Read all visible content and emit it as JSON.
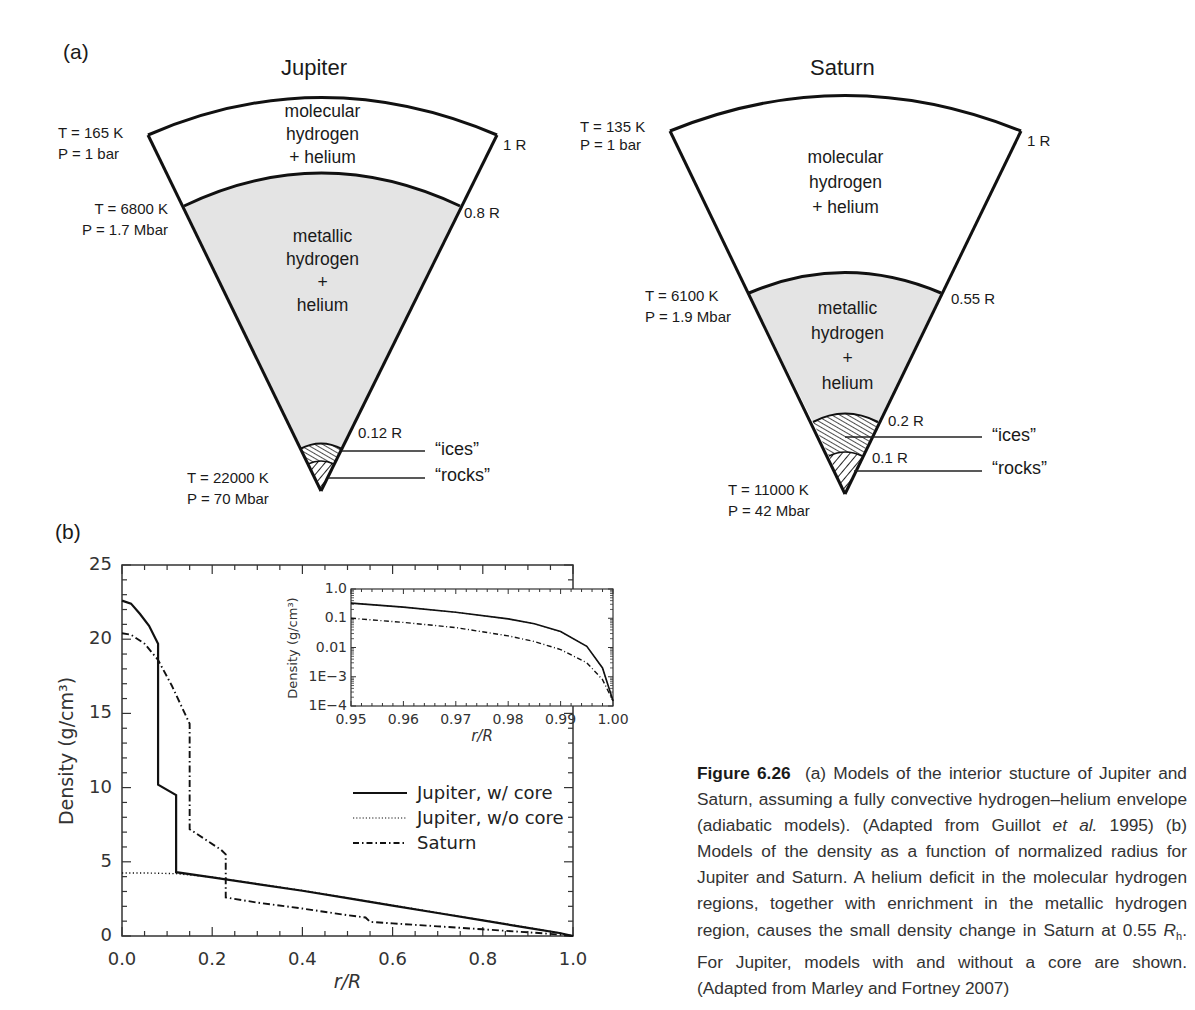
{
  "panel_a": {
    "label": "(a)",
    "jupiter": {
      "title": "Jupiter",
      "outer": {
        "T": "T = 165 K",
        "P": "P = 1 bar",
        "radius": "1 R"
      },
      "molecular_layer": [
        "molecular",
        "hydrogen",
        "+ helium"
      ],
      "transition": {
        "T": "T = 6800 K",
        "P": "P = 1.7 Mbar",
        "radius": "0.8 R"
      },
      "metallic_layer": [
        "metallic",
        "hydrogen",
        "+",
        "helium"
      ],
      "core_radius": "0.12 R",
      "ices_label": "“ices”",
      "rocks_label": "“rocks”",
      "center": {
        "T": "T = 22000 K",
        "P": "P = 70 Mbar"
      }
    },
    "saturn": {
      "title": "Saturn",
      "outer": {
        "T": "T = 135 K",
        "P": "P = 1 bar",
        "radius": "1 R"
      },
      "molecular_layer": [
        "molecular",
        "hydrogen",
        "+ helium"
      ],
      "transition": {
        "T": "T = 6100 K",
        "P": "P = 1.9 Mbar",
        "radius": "0.55 R"
      },
      "metallic_layer": [
        "metallic",
        "hydrogen",
        "+",
        "helium"
      ],
      "ices_radius": "0.2 R",
      "rocks_radius": "0.1 R",
      "ices_label": "“ices”",
      "rocks_label": "“rocks”",
      "center": {
        "T": "T = 11000 K",
        "P": "P = 42 Mbar"
      }
    }
  },
  "panel_b": {
    "label": "(b)"
  },
  "chart_data": [
    {
      "type": "line",
      "title": "",
      "xlabel": "r/R",
      "ylabel": "Density (g/cm³)",
      "xlim": [
        0.0,
        1.0
      ],
      "ylim": [
        0,
        25
      ],
      "xticks": [
        "0.0",
        "0.2",
        "0.4",
        "0.6",
        "0.8",
        "1.0"
      ],
      "yticks": [
        "0",
        "5",
        "10",
        "15",
        "20",
        "25"
      ],
      "grid": false,
      "legend_position": "center-right",
      "series": [
        {
          "name": "Jupiter, w/ core",
          "style": "solid",
          "x": [
            0.0,
            0.02,
            0.04,
            0.06,
            0.08,
            0.08,
            0.12,
            0.12,
            0.2,
            0.3,
            0.4,
            0.5,
            0.6,
            0.7,
            0.8,
            0.9,
            0.97,
            1.0
          ],
          "y": [
            22.6,
            22.4,
            21.7,
            20.9,
            19.7,
            10.2,
            9.5,
            4.3,
            3.95,
            3.5,
            3.05,
            2.55,
            2.05,
            1.55,
            1.05,
            0.55,
            0.2,
            0.0
          ]
        },
        {
          "name": "Jupiter, w/o core",
          "style": "dotted",
          "x": [
            0.0,
            0.05,
            0.12,
            0.2,
            0.3,
            0.4,
            0.5,
            0.6,
            0.7,
            0.8,
            0.9,
            0.97,
            1.0
          ],
          "y": [
            4.25,
            4.25,
            4.2,
            3.97,
            3.52,
            3.07,
            2.57,
            2.07,
            1.57,
            1.07,
            0.57,
            0.2,
            0.0
          ]
        },
        {
          "name": "Saturn",
          "style": "dash-dot",
          "x": [
            0.0,
            0.02,
            0.05,
            0.08,
            0.11,
            0.15,
            0.15,
            0.22,
            0.23,
            0.23,
            0.3,
            0.4,
            0.5,
            0.54,
            0.55,
            0.6,
            0.7,
            0.8,
            0.9,
            0.97,
            1.0
          ],
          "y": [
            20.4,
            20.3,
            19.7,
            18.6,
            16.9,
            14.3,
            7.2,
            5.8,
            5.5,
            2.6,
            2.25,
            1.85,
            1.4,
            1.25,
            0.95,
            0.85,
            0.65,
            0.45,
            0.25,
            0.1,
            0.0
          ]
        }
      ]
    },
    {
      "type": "line",
      "title": "inset",
      "xlabel": "r/R",
      "ylabel": "Density (g/cm³)",
      "xscale": "linear",
      "yscale": "log",
      "xlim": [
        0.95,
        1.0
      ],
      "ylim": [
        0.0001,
        1.0
      ],
      "xticks": [
        "0.95",
        "0.96",
        "0.97",
        "0.98",
        "0.99",
        "1.00"
      ],
      "yticks": [
        "1E−4",
        "1E−3",
        "0.01",
        "0.1",
        "1.0"
      ],
      "grid": false,
      "series": [
        {
          "name": "Jupiter, w/ core",
          "style": "solid",
          "x": [
            0.95,
            0.96,
            0.97,
            0.98,
            0.985,
            0.99,
            0.995,
            0.998,
            1.0
          ],
          "y": [
            0.33,
            0.24,
            0.16,
            0.095,
            0.065,
            0.035,
            0.011,
            0.002,
            0.00015
          ]
        },
        {
          "name": "Jupiter, w/o core",
          "style": "dotted",
          "x": [
            0.95,
            0.96,
            0.97,
            0.98,
            0.985,
            0.99,
            0.995,
            0.998,
            1.0
          ],
          "y": [
            0.33,
            0.24,
            0.16,
            0.095,
            0.065,
            0.035,
            0.011,
            0.002,
            0.00015
          ]
        },
        {
          "name": "Saturn",
          "style": "dash-dot",
          "x": [
            0.95,
            0.96,
            0.97,
            0.98,
            0.985,
            0.99,
            0.995,
            0.998,
            1.0
          ],
          "y": [
            0.1,
            0.072,
            0.048,
            0.025,
            0.016,
            0.0085,
            0.003,
            0.0008,
            0.00015
          ]
        }
      ]
    }
  ],
  "caption": {
    "figure_label": "Figure 6.26",
    "text_1": "(a) Models of the interior stucture of Jupiter and Saturn, assuming a fully convective hydrogen–helium envelope (adiabatic models). (Adapted from Guillot ",
    "etal": "et al.",
    "text_2": " 1995) (b) Models of the density as a function of normalized radius for Jupiter and Saturn. A helium deficit in the molecular hydrogen regions, together with enrichment in the metallic hydrogen region, causes the small density change in Saturn at 0.55 ",
    "Rh": "R",
    "Rh_sub": "h",
    "text_3": ". For Jupiter, models with and without a core are shown. (Adapted from Marley and Fortney 2007)"
  }
}
